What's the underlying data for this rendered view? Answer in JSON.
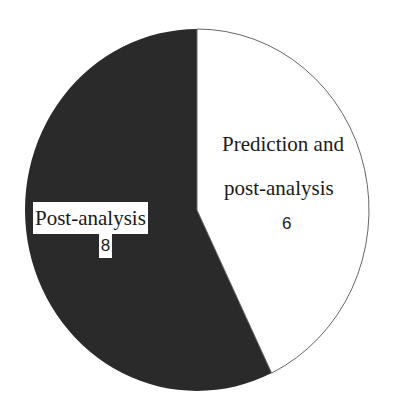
{
  "chart_data": {
    "type": "pie",
    "title": "",
    "categories": [
      "Prediction and post-analysis",
      "Post-analysis"
    ],
    "values": [
      6,
      8
    ],
    "colors": [
      "#ffffff",
      "#2a2a2a"
    ],
    "start_angle_deg": 0,
    "direction": "clockwise",
    "legend": "none",
    "data_labels": [
      {
        "line1": "Prediction and",
        "line2": "post-analysis",
        "value": "6"
      },
      {
        "line1": "Post-analysis",
        "value": "8"
      }
    ]
  },
  "colors": {
    "dark_slice": "#2a2a2a",
    "light_slice": "#ffffff",
    "outline": "#666666"
  }
}
